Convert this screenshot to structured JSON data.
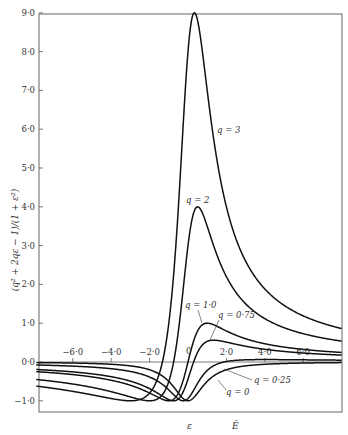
{
  "chart_data": {
    "type": "line",
    "title": "",
    "xlabel": "ε",
    "xlabel_secondary": "Ē",
    "ylabel": "(q² + 2qε − 1)/(1 + ε²)",
    "xlim": [
      -7.9,
      8.0
    ],
    "ylim": [
      -1.3,
      9.0
    ],
    "grid": false,
    "legend": "inline curve labels",
    "x_ticks": [
      {
        "value": -6,
        "label": "−6·0"
      },
      {
        "value": -4,
        "label": "−4·0"
      },
      {
        "value": -2,
        "label": "−2·0"
      },
      {
        "value": 0,
        "label": "0"
      },
      {
        "value": 2,
        "label": "2·0"
      },
      {
        "value": 4,
        "label": "4·0"
      },
      {
        "value": 6,
        "label": "6·0"
      }
    ],
    "y_ticks": [
      {
        "value": 9,
        "label": "9·0"
      },
      {
        "value": 8,
        "label": "8·0"
      },
      {
        "value": 7,
        "label": "7·0"
      },
      {
        "value": 6,
        "label": "6·0"
      },
      {
        "value": 5,
        "label": "5·0"
      },
      {
        "value": 4,
        "label": "4·0"
      },
      {
        "value": 3,
        "label": "3·0"
      },
      {
        "value": 2,
        "label": "2·0"
      },
      {
        "value": 1,
        "label": "1·0"
      },
      {
        "value": 0,
        "label": "0·0"
      },
      {
        "value": -1,
        "label": "−1·0"
      }
    ],
    "function": "f(ε) = (q² + 2qε − 1)/(1 + ε²)",
    "series": [
      {
        "name": "q = 3",
        "q": 3,
        "peak": {
          "x": 0.33,
          "y": 9.0
        },
        "min": {
          "x": -3.0,
          "y": -1.0
        }
      },
      {
        "name": "q = 2",
        "q": 2,
        "peak": {
          "x": 0.5,
          "y": 4.0
        },
        "min": {
          "x": -2.0,
          "y": -1.0
        }
      },
      {
        "name": "q = 1·0",
        "q": 1.0,
        "peak": {
          "x": 1.0,
          "y": 1.0
        },
        "min": {
          "x": -1.0,
          "y": -1.0
        }
      },
      {
        "name": "q = 0·75",
        "q": 0.75,
        "peak": {
          "x": 1.33,
          "y": 0.56
        },
        "min": {
          "x": -0.75,
          "y": -1.0
        }
      },
      {
        "name": "q = 0·25",
        "q": 0.25,
        "peak": {
          "x": 4.0,
          "y": 0.06
        },
        "min": {
          "x": -0.25,
          "y": -1.0
        }
      },
      {
        "name": "q = 0",
        "q": 0,
        "peak": null,
        "min": {
          "x": 0,
          "y": -1.0
        }
      }
    ]
  },
  "labels": {
    "q3": "q = 3",
    "q2": "q = 2",
    "q1": "q = 1·0",
    "q075": "q = 0·75",
    "q025": "q = 0·25",
    "q0": "q = 0",
    "x_eps": "ε",
    "x_E": "Ē",
    "ylabel": "(q² + 2qε − 1)/(1 + ε²)"
  }
}
